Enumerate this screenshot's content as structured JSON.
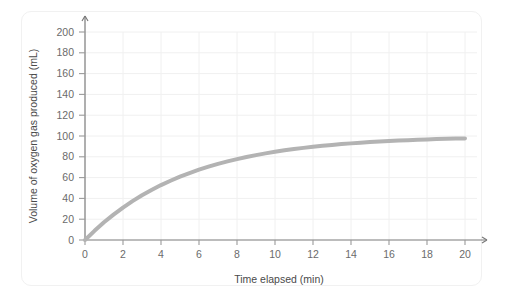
{
  "chart_data": {
    "type": "line",
    "title": "",
    "xlabel": "Time elapsed (min)",
    "ylabel": "Volume of oxygen gas produced (mL)",
    "xlim": [
      0,
      20
    ],
    "ylim": [
      0,
      200
    ],
    "xticks": [
      0,
      2,
      4,
      6,
      8,
      10,
      12,
      14,
      16,
      18,
      20
    ],
    "yticks": [
      0,
      20,
      40,
      60,
      80,
      100,
      120,
      140,
      160,
      180,
      200
    ],
    "xtick_labels": [
      "0",
      "2",
      "4",
      "6",
      "8",
      "10",
      "12",
      "14",
      "16",
      "18",
      "20"
    ],
    "ytick_labels": [
      "0",
      "20",
      "40",
      "60",
      "80",
      "100",
      "120",
      "140",
      "160",
      "180",
      "200"
    ],
    "grid": true,
    "legend": "none",
    "series": [
      {
        "name": "Volume of oxygen gas produced",
        "color": "#b3b3b3",
        "line_width": 4,
        "x": [
          0,
          0.5,
          1,
          1.5,
          2,
          2.5,
          3,
          3.5,
          4,
          4.5,
          5,
          5.5,
          6,
          6.5,
          7,
          7.5,
          8,
          8.5,
          9,
          9.5,
          10,
          10.5,
          11,
          11.5,
          12,
          12.5,
          13,
          13.5,
          14,
          14.5,
          15,
          15.5,
          16,
          16.5,
          17,
          17.5,
          18,
          18.5,
          19,
          19.5,
          20
        ],
        "values": [
          0,
          8.8,
          17.0,
          24.4,
          31.2,
          37.4,
          43.0,
          48.1,
          52.8,
          57.0,
          60.9,
          64.4,
          67.6,
          70.5,
          73.2,
          75.6,
          77.8,
          79.8,
          81.6,
          83.3,
          84.8,
          86.2,
          87.4,
          88.6,
          89.6,
          90.6,
          91.4,
          92.2,
          92.9,
          93.6,
          94.2,
          94.7,
          95.2,
          95.6,
          96.0,
          96.4,
          96.7,
          97.0,
          97.3,
          97.5,
          97.7
        ]
      }
    ],
    "annotations": [],
    "axis_style": {
      "x_axis_arrow": true,
      "y_axis_arrow": true,
      "axis_color": "#7a7a7a",
      "grid_color": "#f0f0f0",
      "tick_color": "#9a9a9a"
    }
  },
  "figure": {
    "background_color": "#ffffff",
    "card_border_color": "#f1f1f1"
  }
}
